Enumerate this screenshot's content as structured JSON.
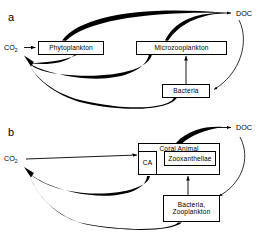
{
  "figure": {
    "type": "flow-diagram"
  },
  "panel_a": {
    "letter": "a",
    "nodes": {
      "co2": "CO2",
      "co2_text": "CO",
      "co2_sub": "2",
      "phytoplankton": "Phytoplankton",
      "microzooplankton": "Microzooplankton",
      "bacteria": "Bacteria",
      "doc": "DOC"
    },
    "edges": [
      {
        "from": "CO2",
        "to": "Phytoplankton",
        "style": "straight-arrow"
      },
      {
        "from": "Phytoplankton",
        "to": "DOC",
        "style": "thick-tapered-curve"
      },
      {
        "from": "Microzooplankton",
        "to": "DOC",
        "style": "thick-tapered-curve"
      },
      {
        "from": "DOC",
        "to": "Bacteria",
        "style": "thin-curve-arrow"
      },
      {
        "from": "Bacteria",
        "to": "Microzooplankton",
        "style": "straight-arrow"
      },
      {
        "from": "Phytoplankton",
        "to": "CO2",
        "style": "thick-tapered-curve"
      },
      {
        "from": "Microzooplankton",
        "to": "CO2",
        "style": "thick-tapered-curve"
      },
      {
        "from": "Bacteria",
        "to": "CO2",
        "style": "thick-tapered-curve"
      }
    ]
  },
  "panel_b": {
    "letter": "b",
    "nodes": {
      "co2": "CO2",
      "co2_text": "CO",
      "co2_sub": "2",
      "coral_animal": "Coral Animal",
      "ca": "CA",
      "zooxanthellae": "Zooxanthellae",
      "bacteria_zooplankton_line1": "Bacteria,",
      "bacteria_zooplankton_line2": "Zooplankton",
      "doc": "DOC"
    },
    "edges": [
      {
        "from": "CO2",
        "to": "CA",
        "style": "straight-arrow"
      },
      {
        "from": "CA",
        "to": "Zooxanthellae",
        "style": "straight-arrow"
      },
      {
        "from": "Coral Animal",
        "to": "DOC",
        "style": "very-thick-tapered-curve"
      },
      {
        "from": "DOC",
        "to": "Bacteria, Zooplankton",
        "style": "thin-curve-arrow"
      },
      {
        "from": "Bacteria, Zooplankton",
        "to": "Zooxanthellae",
        "style": "straight-arrow"
      },
      {
        "from": "Coral Animal",
        "to": "CO2",
        "style": "thick-tapered-curve"
      },
      {
        "from": "Bacteria, Zooplankton",
        "to": "CO2",
        "style": "thick-tapered-curve"
      }
    ]
  },
  "colors": {
    "stroke": "#000000",
    "background": "#ffffff"
  }
}
